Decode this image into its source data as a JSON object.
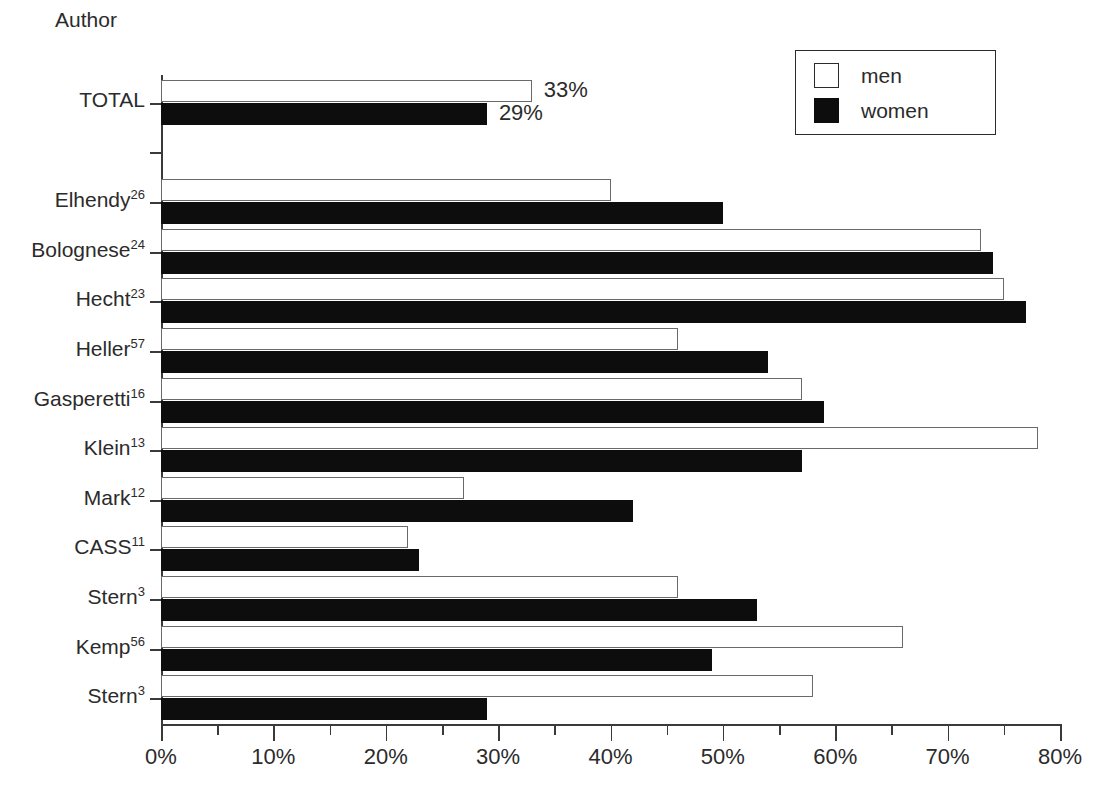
{
  "chart_data": {
    "type": "bar",
    "orientation": "horizontal",
    "title": "",
    "ylabel": "Author",
    "xlabel": "",
    "xlim": [
      0,
      80
    ],
    "x_tick_labels": [
      "0%",
      "10%",
      "20%",
      "30%",
      "40%",
      "50%",
      "60%",
      "70%",
      "80%"
    ],
    "x_tick_values": [
      0,
      10,
      20,
      30,
      40,
      50,
      60,
      70,
      80
    ],
    "x_minor_tick_values": [
      5,
      15,
      25,
      35,
      45,
      55,
      65,
      75
    ],
    "x_unit": "%",
    "grid": false,
    "legend_position": "top-right",
    "categories": [
      "TOTAL",
      "",
      "Elhendy26",
      "Bolognese24",
      "Hecht23",
      "Heller57",
      "Gasperetti16",
      "Klein13",
      "Mark12",
      "CASS11",
      "Stern3",
      "Kemp56",
      "Stern3"
    ],
    "category_labels": [
      {
        "name": "TOTAL",
        "ref": ""
      },
      {
        "name": "",
        "ref": ""
      },
      {
        "name": "Elhendy",
        "ref": "26"
      },
      {
        "name": "Bolognese",
        "ref": "24"
      },
      {
        "name": "Hecht",
        "ref": "23"
      },
      {
        "name": "Heller",
        "ref": "57"
      },
      {
        "name": "Gasperetti",
        "ref": "16"
      },
      {
        "name": "Klein",
        "ref": "13"
      },
      {
        "name": "Mark",
        "ref": "12"
      },
      {
        "name": "CASS",
        "ref": "11"
      },
      {
        "name": "Stern",
        "ref": "3"
      },
      {
        "name": "Kemp",
        "ref": "56"
      },
      {
        "name": "Stern",
        "ref": "3"
      }
    ],
    "series": [
      {
        "name": "men",
        "color": "#ffffff",
        "edge_color": "#6a6a6a",
        "values": [
          33,
          null,
          40,
          73,
          75,
          46,
          57,
          78,
          27,
          22,
          46,
          66,
          58
        ]
      },
      {
        "name": "women",
        "color": "#0d0d0d",
        "edge_color": "#0d0d0d",
        "values": [
          29,
          null,
          50,
          74,
          77,
          54,
          59,
          57,
          42,
          23,
          53,
          49,
          29
        ]
      }
    ],
    "data_labels": [
      {
        "category": "TOTAL",
        "series": "men",
        "text": "33%"
      },
      {
        "category": "TOTAL",
        "series": "women",
        "text": "29%"
      }
    ]
  },
  "legend": {
    "items": [
      {
        "label": "men",
        "style": "outlined"
      },
      {
        "label": "women",
        "style": "filled"
      }
    ]
  }
}
